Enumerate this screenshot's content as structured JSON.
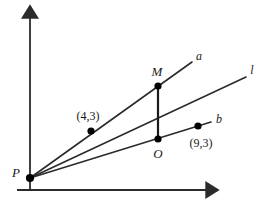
{
  "figure": {
    "background_color": "#ffffff",
    "stroke_color": "#2b2b2b",
    "point_color": "#000000",
    "axes": {
      "origin_px": [
        30,
        190
      ],
      "y_axis": {
        "name": "y-axis",
        "from_px": [
          30,
          190
        ],
        "to_px": [
          30,
          10
        ],
        "arrow": "up"
      },
      "x_axis": {
        "name": "x-axis",
        "from_px": [
          17,
          190
        ],
        "to_px": [
          216,
          190
        ],
        "arrow": "right"
      }
    },
    "points": [
      {
        "id": "P",
        "label": "P",
        "label_px": [
          16,
          172
        ],
        "point_px": [
          30,
          178
        ],
        "dot": true
      },
      {
        "id": "A",
        "label": "(4,3)",
        "label_px": [
          88,
          116
        ],
        "point_px": [
          91,
          131
        ],
        "dot": true
      },
      {
        "id": "M",
        "label": "M",
        "label_px": [
          157,
          71
        ],
        "point_px": [
          158,
          86
        ],
        "dot": true
      },
      {
        "id": "O",
        "label": "O",
        "label_px": [
          158,
          153
        ],
        "point_px": [
          158,
          139
        ],
        "dot": true
      },
      {
        "id": "B",
        "label": "(9,3)",
        "label_px": [
          201,
          143
        ],
        "point_px": [
          198,
          126
        ],
        "dot": true
      }
    ],
    "lines": [
      {
        "id": "a",
        "label": "a",
        "label_px": [
          199,
          56
        ],
        "from_px": [
          30,
          178
        ],
        "to_px": [
          192,
          62
        ]
      },
      {
        "id": "l",
        "label": "l",
        "label_px": [
          252,
          70
        ],
        "from_px": [
          30,
          178
        ],
        "to_px": [
          246,
          77
        ]
      },
      {
        "id": "b",
        "label": "b",
        "label_px": [
          219,
          119
        ],
        "from_px": [
          30,
          178
        ],
        "to_px": [
          211,
          122
        ]
      }
    ],
    "segments": [
      {
        "id": "MO",
        "name": "segment-m-o",
        "from_px": [
          158,
          86
        ],
        "to_px": [
          158,
          139
        ]
      }
    ]
  }
}
